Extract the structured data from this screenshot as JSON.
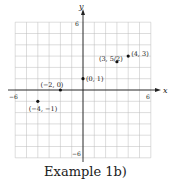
{
  "chart_data": {
    "type": "scatter",
    "title": "Example 1b)",
    "xlabel": "x",
    "ylabel": "y",
    "xlim": [
      -6,
      6
    ],
    "ylim": [
      -6,
      6
    ],
    "grid": true,
    "tick_labels": {
      "x": [
        "-6",
        "6"
      ],
      "y": [
        "6",
        "-6"
      ]
    },
    "points": [
      {
        "x": -4,
        "y": -1,
        "label": "(−4, −1)"
      },
      {
        "x": -2,
        "y": 0,
        "label": "(−2, 0)"
      },
      {
        "x": 0,
        "y": 1,
        "label": "(0, 1)"
      },
      {
        "x": 3,
        "y": 2.5,
        "label": "(3, 5/2)"
      },
      {
        "x": 4,
        "y": 3,
        "label": "(4, 3)"
      }
    ]
  },
  "caption": "Example 1b)",
  "axis": {
    "x_name": "x",
    "y_name": "y",
    "x_min": "−6",
    "x_max": "6",
    "y_max": "6",
    "y_min": "−6"
  }
}
